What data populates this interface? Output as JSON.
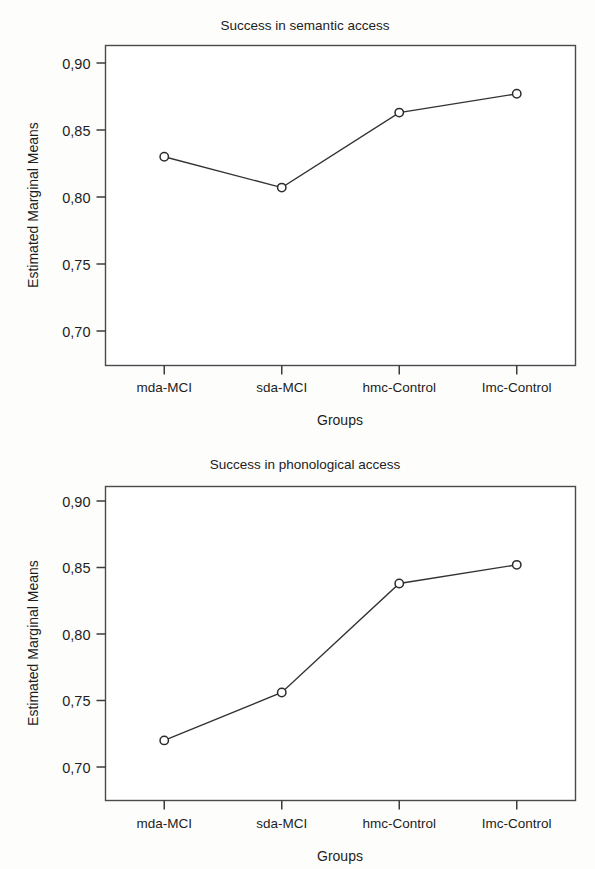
{
  "figure": {
    "y_axis_title": "Estimated Marginal Means",
    "x_axis_title": "Groups",
    "categories": [
      "mda-MCI",
      "sda-MCI",
      "hmc-Control",
      "Imc-Control"
    ],
    "y_tick_labels": [
      "0,90",
      "0,85",
      "0,80",
      "0,75",
      "0,70"
    ],
    "line_color": "#333333",
    "marker_fill": "#ffffff",
    "frame_color": "#4a4a4a"
  },
  "chart_data": [
    {
      "type": "line",
      "title": "Success in semantic access",
      "xlabel": "Groups",
      "ylabel": "Estimated Marginal Means",
      "categories": [
        "mda-MCI",
        "sda-MCI",
        "hmc-Control",
        "Imc-Control"
      ],
      "values": [
        0.83,
        0.807,
        0.863,
        0.877
      ],
      "ylim": [
        0.685,
        0.91
      ],
      "yticks": [
        0.9,
        0.85,
        0.8,
        0.75,
        0.7
      ],
      "ytick_labels": [
        "0,90",
        "0,85",
        "0,80",
        "0,75",
        "0,70"
      ],
      "grid": false,
      "legend": "none",
      "marker": "circle-open"
    },
    {
      "type": "line",
      "title": "Success in phonological access",
      "xlabel": "Groups",
      "ylabel": "Estimated Marginal Means",
      "categories": [
        "mda-MCI",
        "sda-MCI",
        "hmc-Control",
        "Imc-Control"
      ],
      "values": [
        0.72,
        0.756,
        0.838,
        0.852
      ],
      "ylim": [
        0.685,
        0.91
      ],
      "yticks": [
        0.9,
        0.85,
        0.8,
        0.75,
        0.7
      ],
      "ytick_labels": [
        "0,90",
        "0,85",
        "0,80",
        "0,75",
        "0,70"
      ],
      "grid": false,
      "legend": "none",
      "marker": "circle-open"
    }
  ]
}
